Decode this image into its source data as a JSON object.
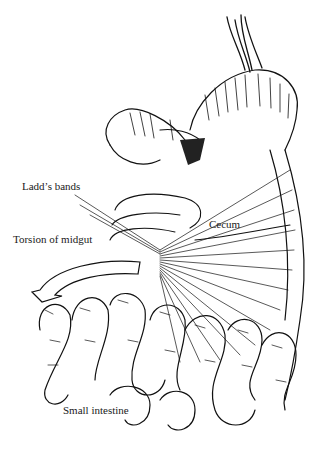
{
  "figure": {
    "labels": [
      {
        "id": "ladds-bands",
        "text": "Ladd’s bands",
        "x": 22,
        "y": 187
      },
      {
        "id": "torsion-of-midgut",
        "text": "Torsion of midgut",
        "x": 13,
        "y": 240
      },
      {
        "id": "cecum",
        "text": "Cecum",
        "x": 209,
        "y": 221
      },
      {
        "id": "small-intestine",
        "text": "Small intestine",
        "x": 63,
        "y": 410
      }
    ],
    "colors": {
      "ink": "#111111",
      "background": "#ffffff",
      "label": "#1a1a1a"
    }
  }
}
